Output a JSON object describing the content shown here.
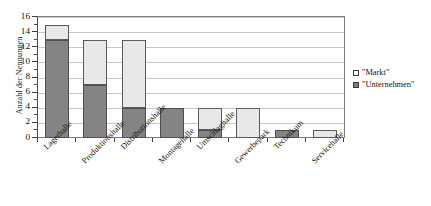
{
  "chart_data": {
    "type": "bar",
    "subtype": "stacked-column",
    "title": "",
    "xlabel": "",
    "ylabel": "Anzahl der Nennungen",
    "ylim": [
      0,
      16
    ],
    "ytick_step": 2,
    "yticks": [
      0,
      2,
      4,
      6,
      8,
      10,
      12,
      14,
      16
    ],
    "ytick_labels": [
      "0",
      "2",
      "4",
      "6",
      "8",
      "10",
      "12",
      "14",
      "16"
    ],
    "minor_ticks": [
      1,
      3,
      5,
      7,
      9,
      11,
      13,
      15
    ],
    "grid": true,
    "grid_axis": "y",
    "legend_position": "right",
    "categories": [
      "Lagerhalle",
      "Produktionshalle",
      "Distributionshalle",
      "Montagehalle",
      "Umschlaghalle",
      "Gewerbepark",
      "Technikum",
      "Servicehalle"
    ],
    "series": [
      {
        "name": "\"Unternehmen\"",
        "color": "#848484",
        "values": [
          13,
          7,
          4,
          4,
          1,
          0,
          1,
          0
        ]
      },
      {
        "name": "\"Markt\"",
        "color": "#e8e8e8",
        "values": [
          2,
          6,
          9,
          0,
          3,
          4,
          0,
          1
        ]
      }
    ],
    "totals": [
      15,
      13,
      13,
      4,
      4,
      4,
      1,
      1
    ]
  },
  "axes": {
    "y_title": "Anzahl der Nennungen"
  },
  "legend": {
    "items": [
      {
        "label": "\"Markt\"",
        "swatch": "legend-swatch-markt"
      },
      {
        "label": "\"Unternehmen\"",
        "swatch": "legend-swatch-unternehmen"
      }
    ]
  },
  "colors": {
    "unternehmen": "#848484",
    "markt": "#e8e8e8",
    "axis": "#3d3d3d",
    "grid": "#c9c9c9",
    "frame": "#7d7d7d",
    "text": "#141414"
  }
}
